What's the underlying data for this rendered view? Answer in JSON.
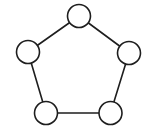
{
  "diagram": {
    "type": "graph",
    "background": "#ffffff",
    "stroke_color": "#1e1e1e",
    "node_fill": "#ffffff",
    "node_radius": 11.5,
    "nodes": [
      {
        "id": "top",
        "cx": 79,
        "cy": 16
      },
      {
        "id": "right",
        "cx": 129,
        "cy": 53
      },
      {
        "id": "bottom-right",
        "cx": 110.5,
        "cy": 113
      },
      {
        "id": "bottom-left",
        "cx": 46,
        "cy": 113
      },
      {
        "id": "left",
        "cx": 28,
        "cy": 52
      }
    ],
    "edges": [
      {
        "from": "top",
        "to": "right"
      },
      {
        "from": "right",
        "to": "bottom-right"
      },
      {
        "from": "bottom-right",
        "to": "bottom-left"
      },
      {
        "from": "bottom-left",
        "to": "left"
      },
      {
        "from": "left",
        "to": "top"
      }
    ]
  }
}
